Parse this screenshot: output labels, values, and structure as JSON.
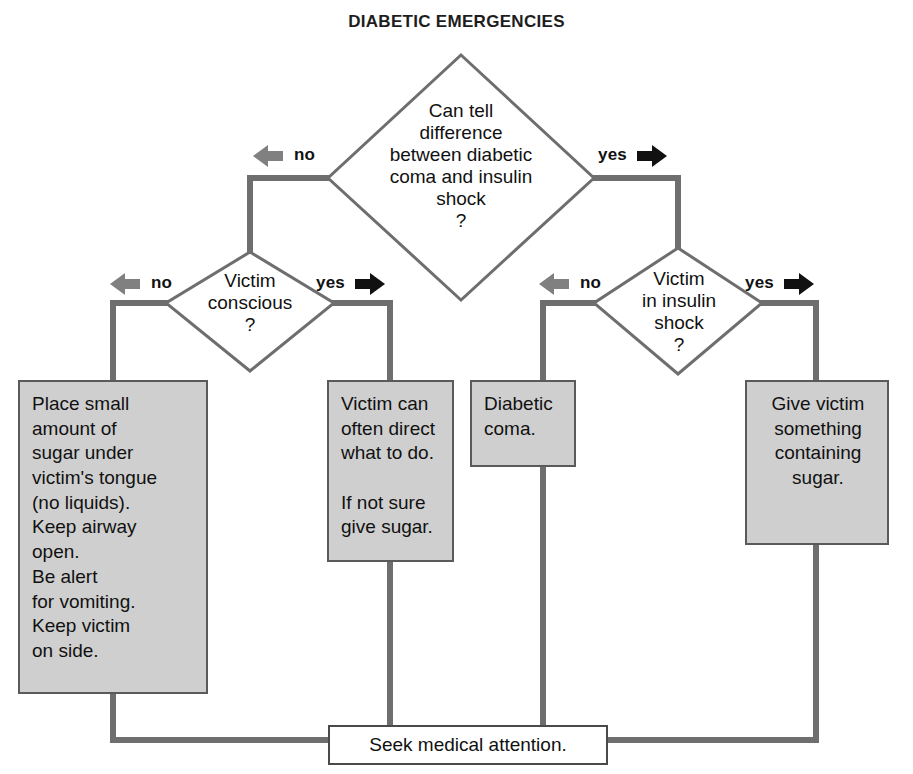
{
  "title": "DIABETIC EMERGENCIES",
  "colors": {
    "line": "#6e6e6e",
    "box_fill": "#cfcfcf",
    "box_border": "#5a5a5a",
    "terminal_fill": "#ffffff",
    "arrow_no": "#808080",
    "arrow_yes": "#111111",
    "text": "#111111",
    "background": "#ffffff"
  },
  "decisions": [
    {
      "id": "can-tell-difference",
      "text": "Can tell\ndifference\nbetween diabetic\ncoma and insulin\nshock\n?",
      "no_label": "no",
      "yes_label": "yes"
    },
    {
      "id": "victim-conscious",
      "text": "Victim\nconscious\n?",
      "no_label": "no",
      "yes_label": "yes"
    },
    {
      "id": "victim-in-insulin-shock",
      "text": "Victim\nin insulin\nshock\n?",
      "no_label": "no",
      "yes_label": "yes"
    }
  ],
  "actions": [
    {
      "id": "place-sugar-under-tongue",
      "text": "Place small\namount of\nsugar under\nvictim's tongue\n(no liquids).\nKeep airway\nopen.\nBe alert\nfor vomiting.\nKeep victim\non side."
    },
    {
      "id": "victim-can-direct",
      "text": "Victim can\noften direct\nwhat to do.\n\nIf not sure\ngive sugar."
    },
    {
      "id": "diabetic-coma",
      "text": "Diabetic\ncoma."
    },
    {
      "id": "give-something-with-sugar",
      "text": "Give victim\nsomething\ncontaining\nsugar."
    }
  ],
  "terminal": {
    "id": "seek-medical-attention",
    "text": "Seek medical attention."
  },
  "icons": {
    "arrow_left": "arrow-left-icon",
    "arrow_right": "arrow-right-icon"
  }
}
